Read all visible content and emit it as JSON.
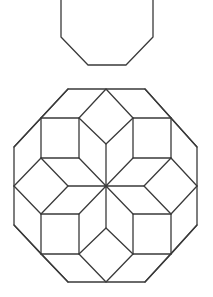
{
  "figure": {
    "stroke_color": "#3a3a3a",
    "background": "#ffffff"
  },
  "small_octagon": {
    "points": "61,0 61,37 88,65 126,65 153,37 153,0"
  },
  "large_octagon": {
    "outline": "68,89 145,89 197,147 197,225 145,282 68,282 14,225 14,147",
    "center": [
      106,
      186
    ],
    "squares": [
      "41,118 79,118 79,158 41,158",
      "133,118 171,118 171,158 133,158",
      "41,214 79,214 79,254 41,254",
      "133,214 171,214 171,254 133,254"
    ],
    "inner_lines": [
      "79,118 106,89 133,118",
      "79,118 106,144 133,118",
      "106,144 106,186",
      "41,158 68,186 41,214",
      "68,186 106,186",
      "171,158 144,186 171,214",
      "144,186 106,186",
      "79,254 106,228 133,254",
      "79,254 106,282 133,254",
      "106,228 106,186",
      "79,158 106,186 133,158",
      "79,214 106,186 133,214",
      "41,118 68,89",
      "171,118 145,89",
      "41,118 14,147",
      "171,118 197,147",
      "41,254 14,225",
      "171,254 197,225",
      "41,254 68,282",
      "171,254 145,282",
      "41,158 14,186",
      "41,214 14,186",
      "171,158 197,186",
      "171,214 197,186"
    ]
  }
}
